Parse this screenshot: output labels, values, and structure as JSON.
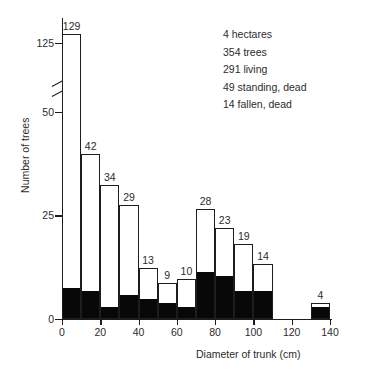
{
  "chart_data": {
    "type": "bar",
    "title": "",
    "subtitle": "",
    "xlabel": "Diameter of trunk (cm)",
    "ylabel": "Number of trees",
    "grid": false,
    "legend_position": "none",
    "axis_break": {
      "present": true,
      "below": 58,
      "above": 120
    },
    "xlim": [
      0,
      140
    ],
    "ylim": [
      0,
      130
    ],
    "xticks": [
      0,
      20,
      40,
      60,
      80,
      100,
      120,
      140
    ],
    "yticks": [
      0,
      25,
      50,
      125
    ],
    "bin_width": 10,
    "categories": [
      "0-10",
      "10-20",
      "20-30",
      "30-40",
      "40-50",
      "50-60",
      "60-70",
      "70-80",
      "80-90",
      "90-100",
      "100-110",
      "110-120",
      "120-130",
      "130-140"
    ],
    "bin_starts": [
      0,
      10,
      20,
      30,
      40,
      50,
      60,
      70,
      80,
      90,
      100,
      110,
      120,
      130
    ],
    "values": [
      129,
      42,
      34,
      29,
      13,
      9,
      10,
      28,
      23,
      19,
      14,
      0,
      0,
      4
    ],
    "data_labels": [
      "129",
      "42",
      "34",
      "29",
      "13",
      "9",
      "10",
      "28",
      "23",
      "19",
      "14",
      "",
      "",
      "4"
    ],
    "series": [
      {
        "name": "living",
        "color": "#ffffff",
        "values": [
          121,
          35,
          31,
          23,
          8,
          5,
          7,
          16,
          12,
          12,
          7,
          0,
          0,
          1
        ]
      },
      {
        "name": "dead",
        "color": "#080808",
        "values": [
          8,
          7,
          3,
          6,
          5,
          4,
          3,
          12,
          11,
          7,
          7,
          0,
          0,
          3
        ]
      }
    ],
    "annotations": [
      "4 hectares",
      "354 trees",
      "291 living",
      "49 standing, dead",
      "14 fallen, dead"
    ]
  },
  "axis": {
    "y_tick_labels": [
      "0",
      "25",
      "50",
      "125"
    ],
    "x_tick_labels": [
      "0",
      "20",
      "40",
      "60",
      "80",
      "100",
      "120",
      "140"
    ]
  }
}
